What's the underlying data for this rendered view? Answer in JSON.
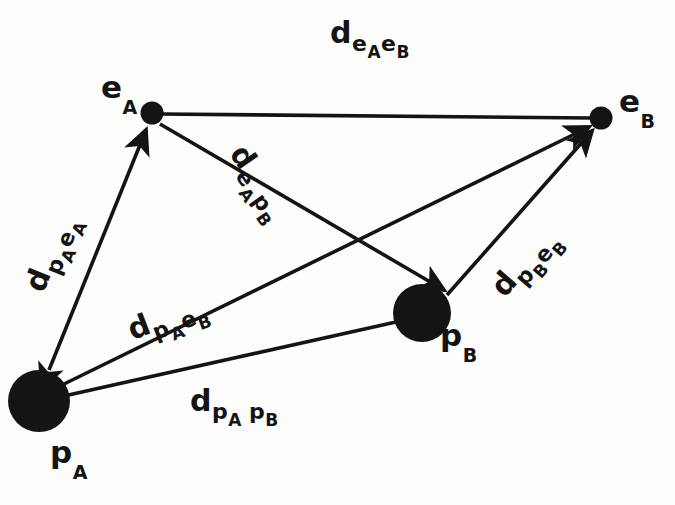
{
  "figure": {
    "stroke_color": "#141414",
    "node_fill_color": "#141414",
    "background_color": "#fdfdfc"
  },
  "nodes": [
    {
      "id": "e_A",
      "label_base": "e",
      "label_sub": "A",
      "kind": "emitter",
      "shape": "small-dot",
      "x": 152,
      "y": 113,
      "radius": 11
    },
    {
      "id": "e_B",
      "label_base": "e",
      "label_sub": "B",
      "kind": "emitter",
      "shape": "small-dot",
      "x": 601,
      "y": 118,
      "radius": 11
    },
    {
      "id": "p_A",
      "label_base": "p",
      "label_sub": "A",
      "kind": "point",
      "shape": "large-disc",
      "x": 39,
      "y": 401,
      "radius": 31
    },
    {
      "id": "p_B",
      "label_base": "p",
      "label_sub": "B",
      "kind": "point",
      "shape": "large-disc",
      "x": 422,
      "y": 313,
      "radius": 29
    }
  ],
  "edges": [
    {
      "id": "d_eA_eB",
      "from": "e_A",
      "to": "e_B",
      "arrow_start": false,
      "arrow_end": false,
      "label_base": "d",
      "label_sub_1": "e",
      "label_sub_2": "A",
      "label_sub_3": "e",
      "label_sub_4": "B"
    },
    {
      "id": "d_pA_eA",
      "from": "p_A",
      "to": "e_A",
      "arrow_start": true,
      "arrow_end": true,
      "label_base": "d",
      "label_sub_1": "p",
      "label_sub_2": "A",
      "label_sub_3": "e",
      "label_sub_4": "A"
    },
    {
      "id": "d_eA_pB",
      "from": "e_A",
      "to": "p_B",
      "arrow_start": false,
      "arrow_end": true,
      "label_base": "d",
      "label_sub_1": "e",
      "label_sub_2": "A",
      "label_sub_3": "p",
      "label_sub_4": "B"
    },
    {
      "id": "d_pA_eB",
      "from": "p_A",
      "to": "e_B",
      "arrow_start": false,
      "arrow_end": true,
      "label_base": "d",
      "label_sub_1": "p",
      "label_sub_2": "A",
      "label_sub_3": "e",
      "label_sub_4": "B"
    },
    {
      "id": "d_pB_eB",
      "from": "p_B",
      "to": "e_B",
      "arrow_start": false,
      "arrow_end": true,
      "label_base": "d",
      "label_sub_1": "p",
      "label_sub_2": "B",
      "label_sub_3": "e",
      "label_sub_4": "B"
    },
    {
      "id": "d_pA_pB",
      "from": "p_A",
      "to": "p_B",
      "arrow_start": false,
      "arrow_end": false,
      "label_base": "d",
      "label_sub_1": "p",
      "label_sub_2": "A",
      "label_sub_3": "p",
      "label_sub_4": "B"
    }
  ]
}
